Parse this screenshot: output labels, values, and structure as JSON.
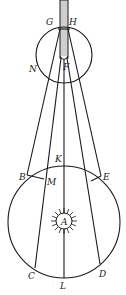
{
  "diagram": {
    "type": "optical/astronomical geometric figure",
    "labels": {
      "G": "G",
      "H": "H",
      "N": "N",
      "F": "F",
      "K": "K",
      "B": "B",
      "M": "M",
      "E": "E",
      "A": "A",
      "C": "C",
      "D": "D",
      "L": "L"
    },
    "colors": {
      "stroke": "#1a1a1a",
      "tube_fill": "#cfcfcf",
      "background": "#ffffff"
    }
  }
}
